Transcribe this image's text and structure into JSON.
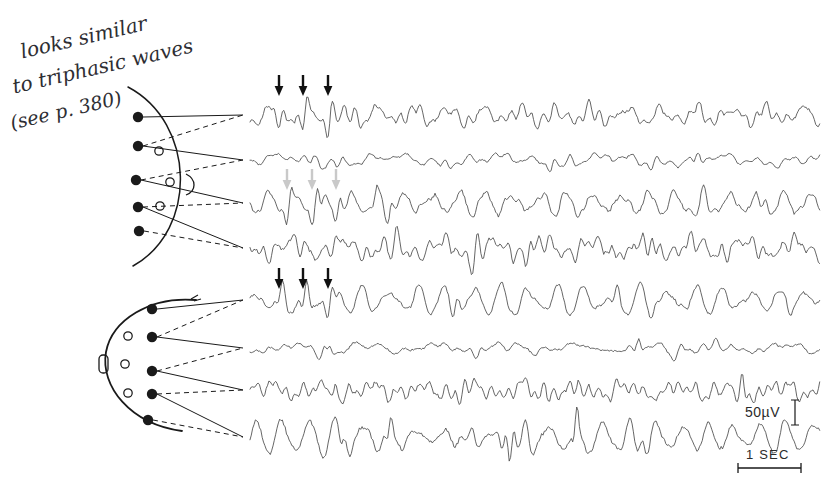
{
  "figure": {
    "kind": "eeg-recording",
    "background_color": "#ffffff",
    "ink_color": "#4a4a4a",
    "dark_ink_color": "#1a1a1a",
    "faint_ink_color": "#b8b8b8",
    "trace_count": 8,
    "trace_left_x": 250,
    "trace_right_x": 820
  },
  "annotation": {
    "present": true,
    "color": "#2e2e33",
    "lines": [
      {
        "text": "looks similar",
        "x": 18,
        "y": 40,
        "rotate": -13,
        "size": 20
      },
      {
        "text": "to triphasic waves",
        "x": 10,
        "y": 75,
        "rotate": -13,
        "size": 20
      },
      {
        "text": "(see p. 380)",
        "x": 8,
        "y": 112,
        "rotate": -13,
        "size": 19
      }
    ]
  },
  "head_diagrams": [
    {
      "name": "upper-head-diagram",
      "orientation": "arc-bulging-right",
      "ear_marker": true,
      "filled_electrodes": [
        {
          "x": 138,
          "y": 117
        },
        {
          "x": 138,
          "y": 146
        },
        {
          "x": 136,
          "y": 180
        },
        {
          "x": 138,
          "y": 207
        },
        {
          "x": 139,
          "y": 231
        }
      ],
      "open_electrodes": [
        {
          "x": 159,
          "y": 151
        },
        {
          "x": 170,
          "y": 182
        },
        {
          "x": 160,
          "y": 206
        }
      ]
    },
    {
      "name": "lower-head-diagram",
      "orientation": "profile-facing-left",
      "ear_marker": true,
      "filled_electrodes": [
        {
          "x": 152,
          "y": 309
        },
        {
          "x": 152,
          "y": 337
        },
        {
          "x": 152,
          "y": 371
        },
        {
          "x": 152,
          "y": 394
        },
        {
          "x": 148,
          "y": 420
        }
      ],
      "open_electrodes": [
        {
          "x": 128,
          "y": 336
        },
        {
          "x": 125,
          "y": 364
        },
        {
          "x": 128,
          "y": 393
        }
      ]
    }
  ],
  "traces": [
    {
      "label": "trace-1",
      "baseline_y": 115,
      "amplitude": 12,
      "group": "upper"
    },
    {
      "label": "trace-2",
      "baseline_y": 160,
      "amplitude": 7,
      "group": "upper"
    },
    {
      "label": "trace-3",
      "baseline_y": 203,
      "amplitude": 11,
      "group": "upper"
    },
    {
      "label": "trace-4",
      "baseline_y": 248,
      "amplitude": 13,
      "group": "upper"
    },
    {
      "label": "trace-5",
      "baseline_y": 300,
      "amplitude": 11,
      "group": "lower"
    },
    {
      "label": "trace-6",
      "baseline_y": 348,
      "amplitude": 8,
      "group": "lower"
    },
    {
      "label": "trace-7",
      "baseline_y": 390,
      "amplitude": 12,
      "group": "lower"
    },
    {
      "label": "trace-8",
      "baseline_y": 437,
      "amplitude": 15,
      "group": "lower"
    }
  ],
  "arrow_markers": [
    {
      "name": "arrow-group-trace-1",
      "trace": "trace-1",
      "color": "#111111",
      "tip_y": 96,
      "positions": [
        279,
        303,
        328
      ]
    },
    {
      "name": "arrow-group-trace-3",
      "trace": "trace-3",
      "color": "#c9c9c9",
      "tip_y": 190,
      "positions": [
        287,
        312,
        336
      ]
    },
    {
      "name": "arrow-group-trace-5",
      "trace": "trace-5",
      "color": "#111111",
      "tip_y": 289,
      "positions": [
        279,
        303,
        328
      ]
    }
  ],
  "scale_bars": {
    "amplitude": {
      "label": "50µV",
      "label_x": 745,
      "label_y": 404,
      "bar_x": 795,
      "bar_top": 400,
      "bar_bottom": 425
    },
    "time": {
      "label": "1 SEC",
      "label_x": 746,
      "label_y": 447,
      "bar_y": 468,
      "bar_left": 738,
      "bar_right": 801
    }
  }
}
